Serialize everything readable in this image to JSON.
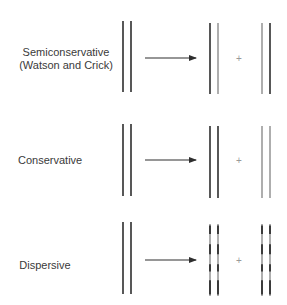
{
  "models": [
    {
      "id": "semiconservative",
      "label_line1": "Semiconservative",
      "label_line2": "(Watson and Crick)",
      "daughter_left": [
        "dark",
        "light"
      ],
      "daughter_right": [
        "light",
        "dark"
      ],
      "pattern": "solid"
    },
    {
      "id": "conservative",
      "label_line1": "Conservative",
      "label_line2": "",
      "daughter_left": [
        "dark",
        "dark"
      ],
      "daughter_right": [
        "light",
        "light"
      ],
      "pattern": "solid"
    },
    {
      "id": "dispersive",
      "label_line1": "Dispersive",
      "label_line2": "",
      "daughter_left": [
        "mixed",
        "mixed"
      ],
      "daughter_right": [
        "mixed",
        "mixed"
      ],
      "pattern": "dispersed"
    }
  ],
  "plus_symbol": "+",
  "colors": {
    "dark": "#2e2e2e",
    "light": "#9a9a9a",
    "text": "#3a3a3a"
  }
}
